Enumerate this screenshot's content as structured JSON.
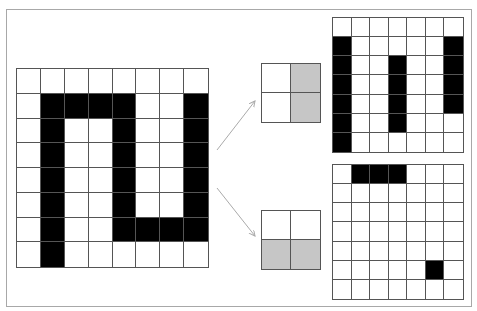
{
  "colors": {
    "filled": "#000000",
    "empty": "#ffffff",
    "filter": "#c6c6c6",
    "arrow": "#aaaaaa",
    "grid_line": "#555555"
  },
  "input_image": {
    "rows": 8,
    "cols": 8,
    "cells": [
      [
        0,
        0,
        0,
        0,
        0,
        0,
        0,
        0
      ],
      [
        0,
        1,
        1,
        1,
        1,
        0,
        0,
        1
      ],
      [
        0,
        1,
        0,
        0,
        1,
        0,
        0,
        1
      ],
      [
        0,
        1,
        0,
        0,
        1,
        0,
        0,
        1
      ],
      [
        0,
        1,
        0,
        0,
        1,
        0,
        0,
        1
      ],
      [
        0,
        1,
        0,
        0,
        1,
        0,
        0,
        1
      ],
      [
        0,
        1,
        0,
        0,
        1,
        1,
        1,
        1
      ],
      [
        0,
        1,
        0,
        0,
        0,
        0,
        0,
        0
      ]
    ]
  },
  "filters": [
    {
      "name": "vertical-edge-filter",
      "rows": 2,
      "cols": 2,
      "cells": [
        [
          0,
          1
        ],
        [
          0,
          1
        ]
      ]
    },
    {
      "name": "horizontal-edge-filter",
      "rows": 2,
      "cols": 2,
      "cells": [
        [
          0,
          0
        ],
        [
          1,
          1
        ]
      ]
    }
  ],
  "feature_maps": [
    {
      "name": "vertical-feature-map",
      "rows": 7,
      "cols": 7,
      "cells": [
        [
          0,
          0,
          0,
          0,
          0,
          0,
          0
        ],
        [
          1,
          0,
          0,
          0,
          0,
          0,
          1
        ],
        [
          1,
          0,
          0,
          1,
          0,
          0,
          1
        ],
        [
          1,
          0,
          0,
          1,
          0,
          0,
          1
        ],
        [
          1,
          0,
          0,
          1,
          0,
          0,
          1
        ],
        [
          1,
          0,
          0,
          1,
          0,
          0,
          0
        ],
        [
          1,
          0,
          0,
          0,
          0,
          0,
          0
        ]
      ]
    },
    {
      "name": "horizontal-feature-map",
      "rows": 7,
      "cols": 7,
      "cells": [
        [
          0,
          1,
          1,
          1,
          0,
          0,
          0
        ],
        [
          0,
          0,
          0,
          0,
          0,
          0,
          0
        ],
        [
          0,
          0,
          0,
          0,
          0,
          0,
          0
        ],
        [
          0,
          0,
          0,
          0,
          0,
          0,
          0
        ],
        [
          0,
          0,
          0,
          0,
          0,
          0,
          0
        ],
        [
          0,
          0,
          0,
          0,
          0,
          1,
          0
        ],
        [
          0,
          0,
          0,
          0,
          0,
          0,
          0
        ]
      ]
    }
  ]
}
